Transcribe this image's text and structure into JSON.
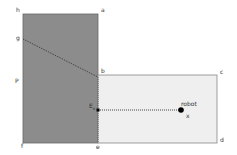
{
  "diagram": {
    "colors": {
      "dark_region": "#8c8c8c",
      "light_region": "#efefef",
      "edge": "#666666",
      "dotted": "#333333",
      "point": "#000000"
    },
    "labels": {
      "h": "h",
      "a": "a",
      "g": "g",
      "b": "b",
      "c": "c",
      "p": "P",
      "e_point": "E",
      "e_sub": "x",
      "robot": "robot",
      "x": "x",
      "f": "f",
      "e": "e",
      "d": "d"
    }
  }
}
